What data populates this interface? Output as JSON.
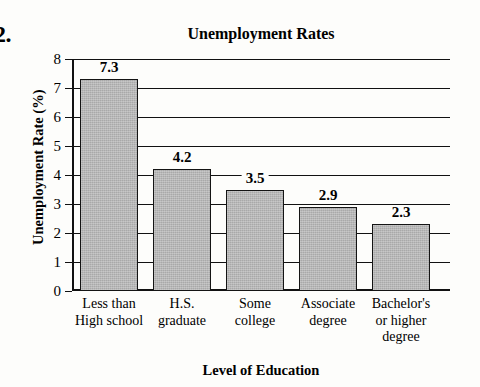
{
  "question_number": "2.",
  "chart_data": {
    "type": "bar",
    "title": "Unemployment Rates",
    "xlabel": "Level of Education",
    "ylabel": "Unemployment Rate (%)",
    "categories": [
      "Less than\nHigh school",
      "H.S.\ngraduate",
      "Some\ncollege",
      "Associate\ndegree",
      "Bachelor's\nor higher\ndegree"
    ],
    "values": [
      7.3,
      4.2,
      3.5,
      2.9,
      2.3
    ],
    "value_labels": [
      "7.3",
      "4.2",
      "3.5",
      "2.9",
      "2.3"
    ],
    "ylim": [
      0,
      8
    ],
    "yticks": [
      0,
      1,
      2,
      3,
      4,
      5,
      6,
      7,
      8
    ],
    "ytick_labels": [
      "0",
      "1",
      "2",
      "3",
      "4",
      "5",
      "6",
      "7",
      "8"
    ],
    "grid": true,
    "legend": "none",
    "bar_color": "#a9a9a9",
    "bar_edge_color": "#141414",
    "background": "#fdfdfb"
  }
}
